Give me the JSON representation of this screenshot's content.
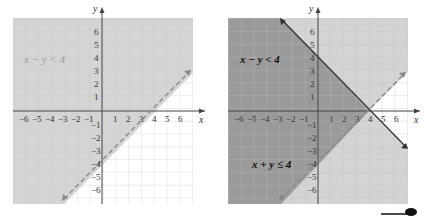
{
  "figures": [
    {
      "id": "left",
      "inequality_label": "x − y < 4",
      "axis_x_label": "x",
      "axis_y_label": "y",
      "x_ticks": [
        "−6",
        "−5",
        "−4",
        "−3",
        "−2",
        "−1",
        "1",
        "2",
        "3",
        "4",
        "5",
        "6"
      ],
      "y_ticks": [
        "6",
        "5",
        "4",
        "3",
        "2",
        "1",
        "−1",
        "−2",
        "−3",
        "−4",
        "−5",
        "−6"
      ],
      "boundary": {
        "equation": "x − y = 4",
        "style": "dashed"
      }
    },
    {
      "id": "right",
      "inequality_label_1": "x − y < 4",
      "inequality_label_2": "x + y ≤ 4",
      "axis_x_label": "x",
      "axis_y_label": "y",
      "x_ticks": [
        "−6",
        "−5",
        "−4",
        "−3",
        "−2",
        "−1",
        "1",
        "2",
        "3",
        "4",
        "5",
        "6"
      ],
      "y_ticks": [
        "6",
        "5",
        "4",
        "3",
        "2",
        "1",
        "−1",
        "−2",
        "−3",
        "−4",
        "−5",
        "−6"
      ],
      "boundaries": [
        {
          "equation": "x − y = 4",
          "style": "dashed"
        },
        {
          "equation": "x + y = 4",
          "style": "solid"
        }
      ]
    }
  ],
  "colors": {
    "light_shade": "#d4d4d4",
    "dark_shade": "#9a9a9a",
    "grid": "#c8c8c8",
    "axis": "#444444",
    "dashed_line": "#8a8a8a",
    "solid_line": "#333333",
    "left_label": "#9a9a9a",
    "right_label": "#111111"
  }
}
